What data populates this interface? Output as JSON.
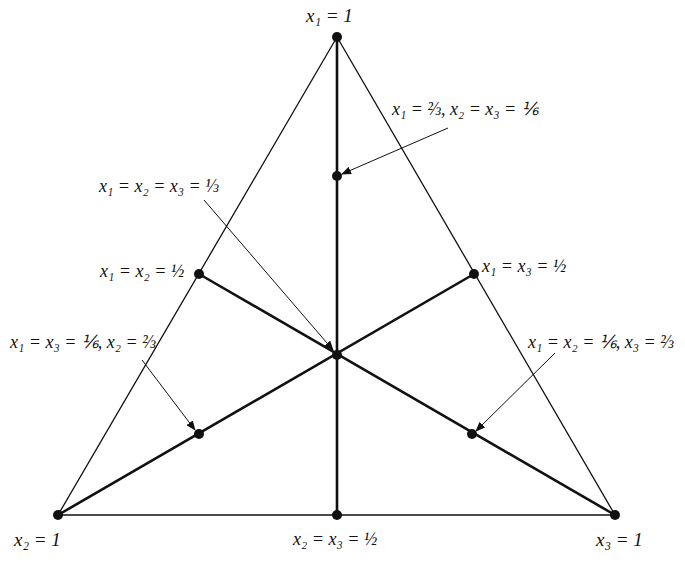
{
  "diagram": {
    "type": "simplex-triangle",
    "vertices": [
      {
        "id": "top",
        "label": "x1 = 1",
        "x": 337,
        "y": 37
      },
      {
        "id": "bottom-left",
        "label": "x2 = 1",
        "x": 58,
        "y": 515
      },
      {
        "id": "bottom-right",
        "label": "x3 = 1",
        "x": 615,
        "y": 515
      }
    ],
    "points": [
      {
        "id": "p-top-inner",
        "label": "x1 = 2/3, x2 = x3 = 1/6",
        "x": 337,
        "y": 176
      },
      {
        "id": "p-center",
        "label": "x1 = x2 = x3 = 1/3",
        "x": 337,
        "y": 355
      },
      {
        "id": "p-left-mid",
        "label": "x1 = x2 = 1/2",
        "x": 199,
        "y": 274
      },
      {
        "id": "p-right-mid",
        "label": "x1 = x3 = 1/2",
        "x": 474,
        "y": 274
      },
      {
        "id": "p-left-inner",
        "label": "x1 = x3 = 1/6, x2 = 2/3",
        "x": 199,
        "y": 434
      },
      {
        "id": "p-right-inner",
        "label": "x1 = x2 = 1/6, x3 = 2/3",
        "x": 472,
        "y": 434
      },
      {
        "id": "p-bottom-mid",
        "label": "x2 = x3 = 1/2",
        "x": 337,
        "y": 515
      }
    ]
  },
  "labels": {
    "top": "x₁ = 1",
    "left": "x₂ = 1",
    "right": "x₃ = 1",
    "bottom_mid": "x₂ = x₃ = ½",
    "top_inner": "x₁ = ⅔, x₂ = x₃ = ⅙",
    "center": "x₁ = x₂ = x₃ = ⅓",
    "left_mid": "x₁ = x₂ = ½",
    "right_mid": "x₁ = x₃ = ½",
    "left_inner": "x₁ = x₃ = ⅙, x₂ = ⅔",
    "right_inner": "x₁ = x₂ = ⅙, x₃ = ⅔"
  }
}
